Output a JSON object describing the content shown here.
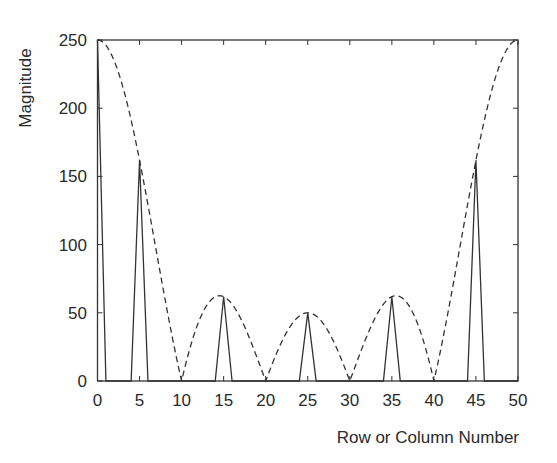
{
  "chart_data": {
    "type": "line",
    "title": "",
    "xlabel": "Row or Column Number",
    "ylabel": "Magnitude",
    "xlim": [
      0,
      50
    ],
    "ylim": [
      0,
      250
    ],
    "xticks": [
      0,
      5,
      10,
      15,
      20,
      25,
      30,
      35,
      40,
      45,
      50
    ],
    "yticks": [
      0,
      50,
      100,
      150,
      200,
      250
    ],
    "grid": false,
    "legend": null,
    "series": [
      {
        "name": "Sampled magnitude (solid)",
        "style": "solid",
        "x": [
          0,
          1,
          4,
          5,
          6,
          14,
          15,
          16,
          24,
          25,
          26,
          34,
          35,
          36,
          44,
          45,
          46
        ],
        "values": [
          250,
          0,
          0,
          161.8,
          0,
          0,
          61.8,
          0,
          0,
          50,
          0,
          0,
          61.8,
          0,
          0,
          161.8,
          0
        ]
      },
      {
        "name": "Continuous envelope (dashed)",
        "style": "dashed",
        "formula": "|50*sin(pi*x/10)/sin(pi*x/50)|",
        "x": [
          0,
          5,
          10,
          15,
          20,
          25,
          30,
          35,
          40,
          45,
          50
        ],
        "values": [
          250,
          161.8,
          0,
          61.8,
          0,
          50,
          0,
          61.8,
          0,
          161.8,
          250
        ]
      }
    ]
  },
  "colors": {
    "line": "#333333",
    "axis": "#333333",
    "background": "#ffffff"
  }
}
